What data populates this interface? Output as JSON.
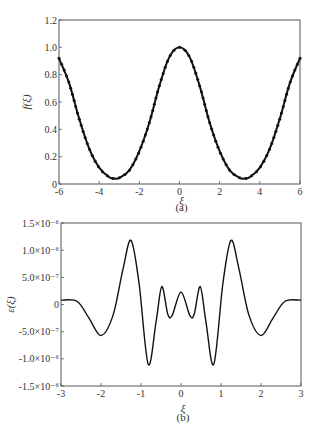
{
  "chart_data": [
    {
      "panel": "a",
      "type": "line",
      "title": "",
      "caption": "(a)",
      "xlabel": "ξ",
      "ylabel": "f(ξ)",
      "xlim": [
        -6,
        6
      ],
      "ylim": [
        0,
        1.2
      ],
      "xticks": [
        -6,
        -4,
        -2,
        0,
        2,
        4,
        6
      ],
      "xtick_labels": [
        "-6",
        "-4",
        "-2",
        "0",
        "2",
        "4",
        "6"
      ],
      "yticks": [
        0,
        0.2,
        0.4,
        0.6,
        0.8,
        1.0,
        1.2
      ],
      "ytick_labels": [
        "0",
        "0.2",
        "0.4",
        "0.6",
        "0.8",
        "1.0",
        "1.2"
      ],
      "grid": false,
      "markers": true,
      "x": [
        -6,
        -5.5,
        -5,
        -4.5,
        -4,
        -3.5,
        -3.2,
        -3,
        -2.5,
        -2,
        -1.5,
        -1,
        -0.5,
        0,
        0.5,
        1,
        1.5,
        2,
        2.5,
        3,
        3.2,
        3.5,
        4,
        4.5,
        5,
        5.5,
        6
      ],
      "values": [
        0.92,
        0.74,
        0.48,
        0.26,
        0.12,
        0.05,
        0.04,
        0.045,
        0.1,
        0.24,
        0.45,
        0.72,
        0.93,
        1.0,
        0.93,
        0.72,
        0.45,
        0.24,
        0.1,
        0.045,
        0.04,
        0.05,
        0.12,
        0.26,
        0.48,
        0.74,
        0.92
      ]
    },
    {
      "panel": "b",
      "type": "line",
      "title": "",
      "caption": "(b)",
      "xlabel": "ξ",
      "ylabel": "ε(ξ)",
      "xlim": [
        -3,
        3
      ],
      "ylim": [
        -1.5e-06,
        1.5e-06
      ],
      "xticks": [
        -3,
        -2,
        -1,
        0,
        1,
        2,
        3
      ],
      "xtick_labels": [
        "-3",
        "-2",
        "-1",
        "0",
        "1",
        "2",
        "3"
      ],
      "yticks": [
        1.5e-06,
        1e-06,
        5e-07,
        0,
        -5e-07,
        -1e-06,
        -1.5e-06
      ],
      "ytick_labels": [
        "1.5×10⁻⁶",
        "1.0×10⁻⁶",
        "5.0×10⁻⁷",
        "0",
        "-5.0×10⁻⁷",
        "-1.0×10⁻⁶",
        "-1.5×10⁻⁶"
      ],
      "grid": false,
      "markers": false,
      "x": [
        -3,
        -2.6,
        -2.3,
        -2.0,
        -1.7,
        -1.45,
        -1.25,
        -1.05,
        -0.82,
        -0.62,
        -0.48,
        -0.33,
        -0.22,
        0,
        0.22,
        0.33,
        0.48,
        0.62,
        0.82,
        1.05,
        1.25,
        1.45,
        1.7,
        2.0,
        2.3,
        2.6,
        3
      ],
      "values": [
        8e-08,
        6e-08,
        -2.5e-07,
        -5.7e-07,
        -2e-07,
        6.5e-07,
        1.18e-06,
        4e-07,
        -1.1e-06,
        -3e-07,
        3.3e-07,
        -1.8e-07,
        -2e-07,
        2.3e-07,
        -2e-07,
        -1.8e-07,
        3.3e-07,
        -3e-07,
        -1.1e-06,
        4e-07,
        1.18e-06,
        6.5e-07,
        -2e-07,
        -5.7e-07,
        -2.5e-07,
        6e-08,
        8e-08
      ]
    }
  ],
  "panels": {
    "a": {
      "caption": "(a)",
      "xlabel": "ξ",
      "ylabel": "f(ξ)"
    },
    "b": {
      "caption": "(b)",
      "xlabel": "ξ",
      "ylabel": "ε(ξ)"
    }
  }
}
